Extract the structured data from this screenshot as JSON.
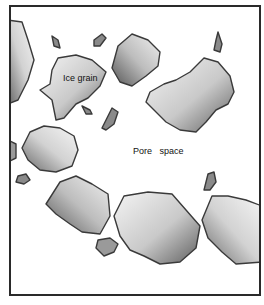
{
  "diagram": {
    "type": "illustration",
    "labels": {
      "ice_grain": "Ice grain",
      "pore_space": "Pore   space"
    },
    "colors": {
      "frame": "#2a2a2a",
      "grain_outline": "#3a3a3a",
      "grain_light": "#f2f2f2",
      "grain_dark": "#6b6b6b",
      "background": "#ffffff"
    }
  }
}
